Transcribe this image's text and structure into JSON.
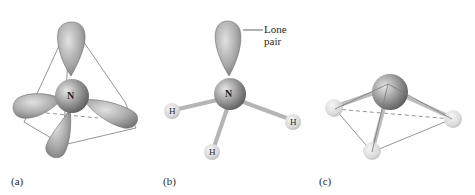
{
  "figure": {
    "panels": [
      {
        "label": "(a)",
        "center_atom": "N",
        "description": "Tetrahedral arrangement of four sp3 orbitals around N"
      },
      {
        "label": "(b)",
        "center_atom": "N",
        "hydrogens": [
          "H",
          "H",
          "H"
        ],
        "annotation": {
          "line1": "Lone",
          "line2": "pair"
        }
      },
      {
        "label": "(c)",
        "description": "Trigonal pyramidal geometry"
      }
    ]
  },
  "colors": {
    "lobe": "#a9a9a9",
    "sphere": "#8e8e8e",
    "hydrogen": "#dcdcdc",
    "edge": "#7a7a7a"
  }
}
